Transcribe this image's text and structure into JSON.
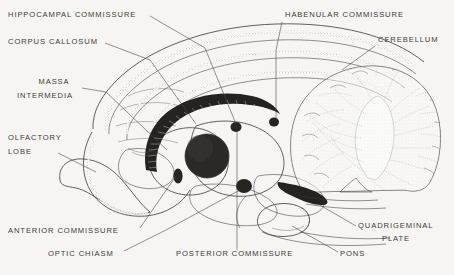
{
  "figure": {
    "background_color": "#f6f5f3",
    "ink_color": "#2e2d2b",
    "label_color": "#3b3a38",
    "style": "black-and-white stipple line engraving"
  },
  "labels": [
    {
      "id": "hippocampal-commissure",
      "text": "HIPPOCAMPAL COMMISSURE",
      "x": 8,
      "y": 17,
      "anchor": "start"
    },
    {
      "id": "corpus-callosum",
      "text": "CORPUS CALLOSUM",
      "x": 8,
      "y": 44,
      "anchor": "start"
    },
    {
      "id": "massa",
      "text": "MASSA",
      "x": 54,
      "y": 84,
      "anchor": "middle"
    },
    {
      "id": "intermedia",
      "text": "INTERMEDIA",
      "x": 45,
      "y": 98,
      "anchor": "middle"
    },
    {
      "id": "olfactory",
      "text": "OLFACTORY",
      "x": 8,
      "y": 140,
      "anchor": "start"
    },
    {
      "id": "lobe",
      "text": "LOBE",
      "x": 8,
      "y": 154,
      "anchor": "start"
    },
    {
      "id": "anterior-commissure",
      "text": "ANTERIOR COMMISSURE",
      "x": 8,
      "y": 233,
      "anchor": "start"
    },
    {
      "id": "optic-chiasm",
      "text": "OPTIC CHIASM",
      "x": 48,
      "y": 256,
      "anchor": "start"
    },
    {
      "id": "posterior-commissure",
      "text": "POSTERIOR COMMISSURE",
      "x": 176,
      "y": 256,
      "anchor": "start"
    },
    {
      "id": "pons",
      "text": "PONS",
      "x": 340,
      "y": 256,
      "anchor": "start"
    },
    {
      "id": "habenular-commissure",
      "text": "HABENULAR COMMISSURE",
      "x": 285,
      "y": 17,
      "anchor": "start"
    },
    {
      "id": "cerebellum",
      "text": "CEREBELLUM",
      "x": 378,
      "y": 42,
      "anchor": "start"
    },
    {
      "id": "quadrigeminal",
      "text": "QUADRIGEMINAL",
      "x": 358,
      "y": 228,
      "anchor": "start"
    },
    {
      "id": "plate",
      "text": "PLATE",
      "x": 382,
      "y": 241,
      "anchor": "start"
    }
  ],
  "structures": [
    {
      "id": "cerebral-hemisphere",
      "name": "Cerebral hemisphere (cortex)"
    },
    {
      "id": "corpus-callosum-band",
      "name": "Corpus callosum"
    },
    {
      "id": "massa-intermedia",
      "name": "Massa intermedia (thalamus)"
    },
    {
      "id": "olfactory-lobe",
      "name": "Olfactory lobe"
    },
    {
      "id": "optic-chiasm-body",
      "name": "Optic chiasm"
    },
    {
      "id": "anterior-commissure-dot",
      "name": "Anterior commissure"
    },
    {
      "id": "posterior-commissure-dot",
      "name": "Posterior commissure"
    },
    {
      "id": "habenular-commissure-dot",
      "name": "Habenular commissure"
    },
    {
      "id": "cerebellum-body",
      "name": "Cerebellum with arbor vitae"
    },
    {
      "id": "pons-body",
      "name": "Pons"
    },
    {
      "id": "quadrigeminal-plate-body",
      "name": "Quadrigeminal plate"
    },
    {
      "id": "brainstem",
      "name": "Brainstem / medulla"
    }
  ]
}
